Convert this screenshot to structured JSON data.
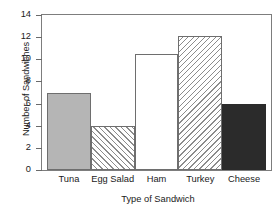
{
  "chart_data": {
    "type": "bar",
    "title": "",
    "xlabel": "Type of Sandwich",
    "ylabel": "Number of Sandwiches",
    "categories": [
      "Tuna",
      "Egg Salad",
      "Ham",
      "Turkey",
      "Cheese"
    ],
    "values": [
      7,
      4,
      10.5,
      12.1,
      6
    ],
    "ylim": [
      0,
      14
    ],
    "yticks": [
      0,
      2,
      4,
      6,
      8,
      10,
      12,
      14
    ],
    "ytick_labels": [
      "0",
      "2",
      "4",
      "6",
      "8",
      "10",
      "12",
      "14"
    ],
    "grid": false,
    "legend": false,
    "legend_position": "none",
    "bar_styles": [
      {
        "category": "Tuna",
        "fill": "solid-gray",
        "color": "#b5b5b5"
      },
      {
        "category": "Egg Salad",
        "fill": "hatch-forward-diagonal",
        "color": "#8c8c8c"
      },
      {
        "category": "Ham",
        "fill": "white",
        "color": "#ffffff"
      },
      {
        "category": "Turkey",
        "fill": "hatch-backward-diagonal",
        "color": "#8c8c8c"
      },
      {
        "category": "Cheese",
        "fill": "solid-dark",
        "color": "#2b2b2b"
      }
    ],
    "axis_color": "#6a6a6a",
    "bar_edge_color": "#6e6e6e"
  }
}
